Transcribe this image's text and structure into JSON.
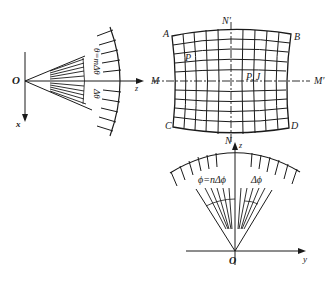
{
  "diagram": {
    "left_panel": {
      "origin_label": "O",
      "x_axis_label": "x",
      "z_axis_label": "z",
      "angle_label": "θ=mΔθ",
      "step_label": "Δθ"
    },
    "grid_panel": {
      "corner_labels": [
        "A",
        "B",
        "C",
        "D"
      ],
      "horizontal_axis_labels": [
        "M",
        "M′"
      ],
      "vertical_axis_labels": [
        "N′",
        "N"
      ],
      "point_label_left": "P",
      "point_label_center": "P, J"
    },
    "bottom_panel": {
      "origin_label": "O",
      "y_axis_label": "y",
      "z_axis_label": "z",
      "angle_label": "ϕ=nΔϕ",
      "step_label": "Δϕ"
    },
    "colors": {
      "ink": "#1a1a1a",
      "background": "#ffffff"
    }
  }
}
